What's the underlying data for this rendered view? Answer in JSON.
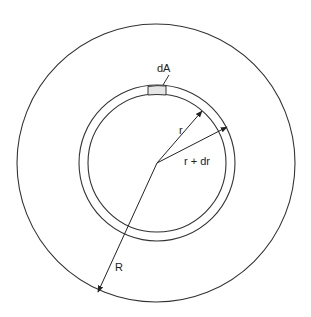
{
  "diagram": {
    "labels": {
      "area_element": "dA",
      "inner_radius": "r",
      "outer_ring_radius": "r + dr",
      "outer_radius": "R"
    },
    "colors": {
      "stroke": "#333333",
      "area_fill": "#e6e6e6",
      "background": "#ffffff"
    },
    "geometry": {
      "center": [
        157,
        163
      ],
      "outer_circle_radius": 139,
      "ring_outer_radius": 78,
      "ring_inner_radius": 69
    }
  }
}
